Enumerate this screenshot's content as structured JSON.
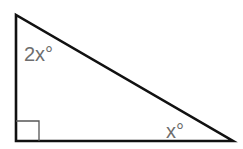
{
  "diagram": {
    "type": "right-triangle",
    "vertices": {
      "top": [
        16,
        15
      ],
      "right_angle": [
        16,
        141
      ],
      "acute_right": [
        233,
        141
      ]
    },
    "angles": {
      "top": {
        "label": "2x°",
        "value_expr": "2x"
      },
      "right_angle": {
        "label": "",
        "marker": "square",
        "value": 90
      },
      "bottom_right": {
        "label": "x°",
        "value_expr": "x"
      }
    },
    "colors": {
      "stroke": "#111111",
      "label": "#6e6e6e",
      "right_angle_marker": "#555555",
      "background": "#ffffff"
    }
  }
}
